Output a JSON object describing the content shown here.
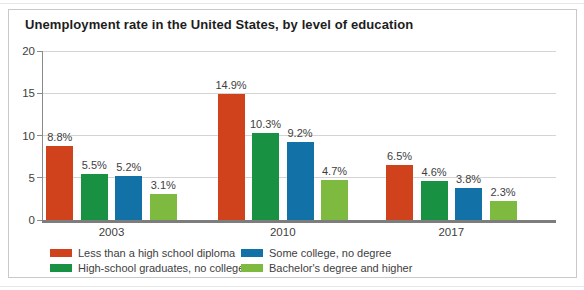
{
  "title": "Unemployment rate in the United States, by level of education",
  "chart_data": {
    "type": "bar",
    "title": "Unemployment rate in the United States, by level of education",
    "categories": [
      "2003",
      "2010",
      "2017"
    ],
    "series": [
      {
        "name": "Less than a high school diploma",
        "color": "#d0421b",
        "values": [
          8.8,
          14.9,
          6.5
        ],
        "labels": [
          "8.8%",
          "14.9%",
          "6.5%"
        ]
      },
      {
        "name": "High-school graduates, no college",
        "color": "#189143",
        "values": [
          5.5,
          10.3,
          4.6
        ],
        "labels": [
          "5.5%",
          "10.3%",
          "4.6%"
        ]
      },
      {
        "name": "Some college, no degree",
        "color": "#1271a6",
        "values": [
          5.2,
          9.2,
          3.8
        ],
        "labels": [
          "5.2%",
          "9.2%",
          "3.8%"
        ]
      },
      {
        "name": "Bachelor's degree and higher",
        "color": "#7eba40",
        "values": [
          3.1,
          4.7,
          2.3
        ],
        "labels": [
          "3.1%",
          "4.7%",
          "2.3%"
        ]
      }
    ],
    "ylim": [
      0,
      20
    ],
    "yticks": [
      "0",
      "5",
      "10",
      "15",
      "20"
    ],
    "grid": true,
    "legend_position": "bottom",
    "value_label_format": "{v}%"
  }
}
